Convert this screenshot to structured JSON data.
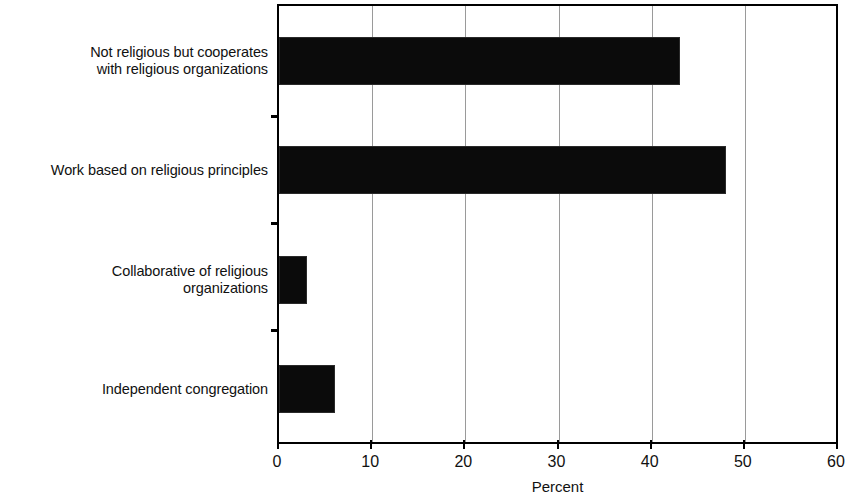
{
  "chart_data": {
    "type": "bar",
    "orientation": "horizontal",
    "title": "",
    "xlabel": "Percent",
    "ylabel": "",
    "xlim": [
      0,
      60
    ],
    "xticks": [
      0,
      10,
      20,
      30,
      40,
      50,
      60
    ],
    "xtick_labels": [
      "0",
      "10",
      "20",
      "30",
      "40",
      "50",
      "60"
    ],
    "grid": "vertical",
    "legend": "none",
    "bar_color": "#0b0b0b",
    "categories": [
      "Independent congregation",
      "Collaborative of religious\norganizations",
      "Work based on religious principles",
      "Not religious but cooperates\nwith religious organizations"
    ],
    "values": [
      6,
      3,
      48,
      43
    ],
    "bars": [
      {
        "label": "Not religious but cooperates\nwith religious organizations",
        "value": 43
      },
      {
        "label": "Work based on religious principles",
        "value": 48
      },
      {
        "label": "Collaborative of religious\norganizations",
        "value": 3
      },
      {
        "label": "Independent congregation",
        "value": 6
      }
    ]
  },
  "axis": {
    "x_title": "Percent"
  }
}
